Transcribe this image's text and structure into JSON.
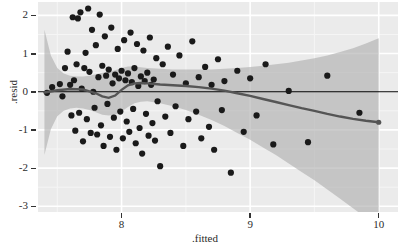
{
  "chart_data": {
    "type": "scatter",
    "title": "",
    "subtitle": "",
    "xlabel": ".fitted",
    "ylabel": ".resid",
    "xlim": [
      7.35,
      10.15
    ],
    "ylim": [
      -3.15,
      2.35
    ],
    "xticks": [
      8,
      9,
      10
    ],
    "xtick_labels": [
      "8",
      "9",
      "10"
    ],
    "yticks": [
      2,
      1,
      0,
      -1,
      -2,
      -3
    ],
    "ytick_labels": [
      "2",
      "1",
      "0",
      "-1",
      "-2",
      "-3"
    ],
    "grid": true,
    "grid_major_color": "#ffffff",
    "grid_minor_color": "#f5f5f5",
    "panel_background": "#ebebeb",
    "legend_position": "none",
    "point_color": "#1a1a1a",
    "point_size": 3.1,
    "reference_line": {
      "name": "zero-line",
      "y": 0,
      "color": "#000000",
      "width": 1.2
    },
    "series": [
      {
        "name": "residuals",
        "type": "scatter",
        "points": [
          [
            7.42,
            -0.03
          ],
          [
            7.46,
            0.12
          ],
          [
            7.52,
            0.2
          ],
          [
            7.54,
            -0.12
          ],
          [
            7.56,
            0.62
          ],
          [
            7.58,
            1.05
          ],
          [
            7.6,
            0.18
          ],
          [
            7.61,
            -0.62
          ],
          [
            7.62,
            1.95
          ],
          [
            7.63,
            0.3
          ],
          [
            7.64,
            -1.02
          ],
          [
            7.65,
            0.72
          ],
          [
            7.66,
            1.92
          ],
          [
            7.67,
            -0.55
          ],
          [
            7.68,
            2.08
          ],
          [
            7.69,
            0.08
          ],
          [
            7.7,
            -1.3
          ],
          [
            7.71,
            0.62
          ],
          [
            7.72,
            1.02
          ],
          [
            7.73,
            -0.72
          ],
          [
            7.74,
            2.18
          ],
          [
            7.75,
            0.52
          ],
          [
            7.76,
            -1.08
          ],
          [
            7.77,
            1.62
          ],
          [
            7.78,
            0.0
          ],
          [
            7.79,
            -0.42
          ],
          [
            7.8,
            1.22
          ],
          [
            7.81,
            -1.12
          ],
          [
            7.82,
            0.38
          ],
          [
            7.83,
            2.02
          ],
          [
            7.84,
            -0.88
          ],
          [
            7.85,
            0.68
          ],
          [
            7.86,
            -1.42
          ],
          [
            7.87,
            1.45
          ],
          [
            7.88,
            0.42
          ],
          [
            7.89,
            -0.32
          ],
          [
            7.9,
            0.58
          ],
          [
            7.91,
            -1.18
          ],
          [
            7.92,
            1.68
          ],
          [
            7.93,
            0.22
          ],
          [
            7.94,
            -0.68
          ],
          [
            7.95,
            0.45
          ],
          [
            7.96,
            -1.52
          ],
          [
            7.97,
            1.12
          ],
          [
            7.98,
            0.35
          ],
          [
            7.99,
            -0.52
          ],
          [
            8.0,
            0.55
          ],
          [
            8.01,
            -1.22
          ],
          [
            8.02,
            1.35
          ],
          [
            8.03,
            0.3
          ],
          [
            8.04,
            -0.78
          ],
          [
            8.05,
            0.48
          ],
          [
            8.06,
            -1.05
          ],
          [
            8.07,
            1.55
          ],
          [
            8.08,
            0.25
          ],
          [
            8.09,
            -0.45
          ],
          [
            8.1,
            0.62
          ],
          [
            8.11,
            -1.35
          ],
          [
            8.12,
            1.25
          ],
          [
            8.13,
            0.15
          ],
          [
            8.14,
            -0.95
          ],
          [
            8.15,
            0.4
          ],
          [
            8.16,
            -1.62
          ],
          [
            8.17,
            1.08
          ],
          [
            8.18,
            0.28
          ],
          [
            8.19,
            -0.58
          ],
          [
            8.2,
            0.5
          ],
          [
            8.21,
            -1.15
          ],
          [
            8.22,
            1.42
          ],
          [
            8.23,
            0.18
          ],
          [
            8.24,
            -0.82
          ],
          [
            8.25,
            0.32
          ],
          [
            8.26,
            -1.28
          ],
          [
            8.27,
            0.88
          ],
          [
            8.28,
            -0.25
          ],
          [
            8.3,
            -1.95
          ],
          [
            8.32,
            0.72
          ],
          [
            8.34,
            -0.65
          ],
          [
            8.36,
            1.18
          ],
          [
            8.38,
            -1.08
          ],
          [
            8.4,
            0.45
          ],
          [
            8.42,
            -0.38
          ],
          [
            8.45,
            0.95
          ],
          [
            8.48,
            -1.42
          ],
          [
            8.5,
            0.22
          ],
          [
            8.52,
            -0.72
          ],
          [
            8.55,
            1.32
          ],
          [
            8.58,
            -0.52
          ],
          [
            8.6,
            0.38
          ],
          [
            8.62,
            -1.22
          ],
          [
            8.65,
            0.65
          ],
          [
            8.68,
            -0.92
          ],
          [
            8.7,
            0.18
          ],
          [
            8.72,
            -1.52
          ],
          [
            8.75,
            0.85
          ],
          [
            8.78,
            -0.48
          ],
          [
            8.8,
            0.28
          ],
          [
            8.85,
            -2.12
          ],
          [
            8.9,
            0.55
          ],
          [
            8.95,
            -1.05
          ],
          [
            9.0,
            0.35
          ],
          [
            9.05,
            -0.62
          ],
          [
            9.12,
            0.72
          ],
          [
            9.18,
            -1.38
          ],
          [
            9.3,
            0.02
          ],
          [
            9.45,
            -1.32
          ],
          [
            9.6,
            0.42
          ],
          [
            9.85,
            -0.55
          ]
        ]
      },
      {
        "name": "loess-smooth",
        "type": "line",
        "color": "#555555",
        "width": 2.4,
        "points": [
          [
            7.4,
            -0.02
          ],
          [
            7.5,
            0.04
          ],
          [
            7.6,
            0.07
          ],
          [
            7.7,
            0.06
          ],
          [
            7.8,
            -0.04
          ],
          [
            7.85,
            -0.12
          ],
          [
            7.9,
            -0.16
          ],
          [
            7.95,
            -0.1
          ],
          [
            8.0,
            0.05
          ],
          [
            8.05,
            0.17
          ],
          [
            8.1,
            0.22
          ],
          [
            8.15,
            0.23
          ],
          [
            8.2,
            0.22
          ],
          [
            8.3,
            0.19
          ],
          [
            8.4,
            0.17
          ],
          [
            8.5,
            0.15
          ],
          [
            8.6,
            0.12
          ],
          [
            8.7,
            0.08
          ],
          [
            8.8,
            0.03
          ],
          [
            8.9,
            -0.04
          ],
          [
            9.0,
            -0.11
          ],
          [
            9.1,
            -0.19
          ],
          [
            9.2,
            -0.27
          ],
          [
            9.3,
            -0.35
          ],
          [
            9.4,
            -0.43
          ],
          [
            9.5,
            -0.5
          ],
          [
            9.6,
            -0.58
          ],
          [
            9.7,
            -0.65
          ],
          [
            9.8,
            -0.71
          ],
          [
            9.9,
            -0.76
          ],
          [
            10.0,
            -0.8
          ]
        ]
      },
      {
        "name": "confidence-band",
        "type": "ribbon",
        "color": "#b0b0b0",
        "opacity": 0.65,
        "upper": [
          [
            7.4,
            1.62
          ],
          [
            7.45,
            0.95
          ],
          [
            7.5,
            0.62
          ],
          [
            7.55,
            0.48
          ],
          [
            7.6,
            0.42
          ],
          [
            7.65,
            0.4
          ],
          [
            7.7,
            0.4
          ],
          [
            7.75,
            0.42
          ],
          [
            7.8,
            0.46
          ],
          [
            7.85,
            0.5
          ],
          [
            7.9,
            0.52
          ],
          [
            7.95,
            0.56
          ],
          [
            8.0,
            0.62
          ],
          [
            8.05,
            0.66
          ],
          [
            8.1,
            0.66
          ],
          [
            8.15,
            0.64
          ],
          [
            8.2,
            0.62
          ],
          [
            8.3,
            0.6
          ],
          [
            8.4,
            0.58
          ],
          [
            8.5,
            0.58
          ],
          [
            8.6,
            0.58
          ],
          [
            8.7,
            0.58
          ],
          [
            8.8,
            0.6
          ],
          [
            8.9,
            0.62
          ],
          [
            9.0,
            0.65
          ],
          [
            9.1,
            0.68
          ],
          [
            9.2,
            0.72
          ],
          [
            9.3,
            0.76
          ],
          [
            9.4,
            0.82
          ],
          [
            9.5,
            0.88
          ],
          [
            9.6,
            0.95
          ],
          [
            9.7,
            1.04
          ],
          [
            9.8,
            1.14
          ],
          [
            9.9,
            1.26
          ],
          [
            10.0,
            1.4
          ]
        ],
        "lower": [
          [
            7.4,
            -1.66
          ],
          [
            7.45,
            -0.98
          ],
          [
            7.5,
            -0.64
          ],
          [
            7.55,
            -0.5
          ],
          [
            7.6,
            -0.44
          ],
          [
            7.65,
            -0.42
          ],
          [
            7.7,
            -0.44
          ],
          [
            7.75,
            -0.48
          ],
          [
            7.8,
            -0.54
          ],
          [
            7.85,
            -0.6
          ],
          [
            7.9,
            -0.62
          ],
          [
            7.95,
            -0.6
          ],
          [
            8.0,
            -0.52
          ],
          [
            8.05,
            -0.4
          ],
          [
            8.1,
            -0.3
          ],
          [
            8.15,
            -0.26
          ],
          [
            8.2,
            -0.25
          ],
          [
            8.3,
            -0.3
          ],
          [
            8.4,
            -0.38
          ],
          [
            8.5,
            -0.48
          ],
          [
            8.6,
            -0.6
          ],
          [
            8.7,
            -0.74
          ],
          [
            8.8,
            -0.9
          ],
          [
            8.9,
            -1.08
          ],
          [
            9.0,
            -1.26
          ],
          [
            9.1,
            -1.46
          ],
          [
            9.2,
            -1.66
          ],
          [
            9.3,
            -1.88
          ],
          [
            9.4,
            -2.1
          ],
          [
            9.5,
            -2.32
          ],
          [
            9.6,
            -2.56
          ],
          [
            9.7,
            -2.8
          ],
          [
            9.8,
            -3.05
          ],
          [
            9.9,
            -3.3
          ],
          [
            10.0,
            -3.55
          ]
        ]
      }
    ]
  }
}
